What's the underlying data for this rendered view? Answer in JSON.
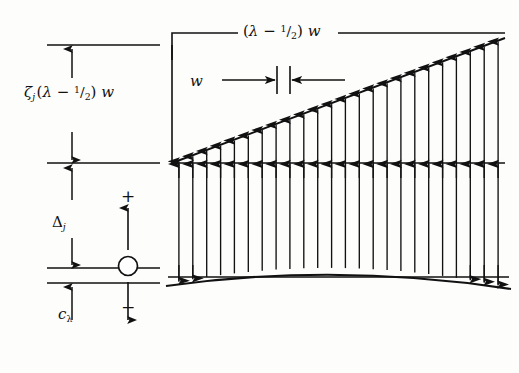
{
  "figure": {
    "background_color": "#fdfdfc",
    "ink_color": "#111111",
    "labels": {
      "top_dimension": "(λ − 1/2) w",
      "top_dimension_parts": {
        "open": "(",
        "lambda": "λ",
        "minus": "−",
        "numerator": "1",
        "slash": "/",
        "denominator": "2",
        "close": ")",
        "w": "w"
      },
      "left_upper_dimension": "ζj (λ − 1/2) w",
      "left_upper_parts": {
        "zeta": "ζ",
        "sub": "j",
        "open": "(",
        "lambda": "λ",
        "minus": "−",
        "numerator": "1",
        "slash": "/",
        "denominator": "2",
        "close": ")",
        "w": "w"
      },
      "panel_width": "w",
      "delta": "Δ",
      "delta_sub": "j",
      "c_lambda": "c",
      "c_lambda_sub": "λ",
      "sign_positive": "+",
      "sign_negative": "−"
    },
    "symbols": {
      "hinge": "hinge-circle",
      "arrow_up": "arrow-up",
      "arrow_down": "arrow-down",
      "arrow_left": "arrow-left",
      "arrow_right": "arrow-right"
    }
  },
  "chart_data": {
    "type": "diagram",
    "n_vectors": 24,
    "geometry": {
      "x_left": 172,
      "x_right": 505,
      "datum_y": 163,
      "envelope_left_y": 163,
      "envelope_right_y": 38,
      "curve_left_y": 283,
      "curve_mid_y": 268,
      "curve_right_y": 287,
      "left_border_x": 172,
      "left_border_top_y": 45,
      "left_border_bottom_y": 163
    },
    "dimension_lines": {
      "top": {
        "y": 33,
        "x_start": 172,
        "x_end": 505,
        "label": "(λ − 1/2) w"
      },
      "panel_w": {
        "y": 80,
        "x_left_tick": 277,
        "x_right_tick": 290,
        "label": "w"
      },
      "left_stack": {
        "tick_top_y": 45,
        "tick_mid_y": 163,
        "tick_low_y": 268,
        "tick_bottom_y": 283,
        "x_start": 47,
        "x_end": 160
      }
    },
    "vector_field": {
      "orientation": "vertical",
      "head_top": "arrow-up",
      "head_bottom": "arrow-down",
      "tip_envelope": "inclined-line",
      "base_envelope": "shallow-curve"
    },
    "sign_convention": {
      "x": 128,
      "positive_label": "+",
      "negative_label": "−",
      "pivot": "circle"
    }
  }
}
